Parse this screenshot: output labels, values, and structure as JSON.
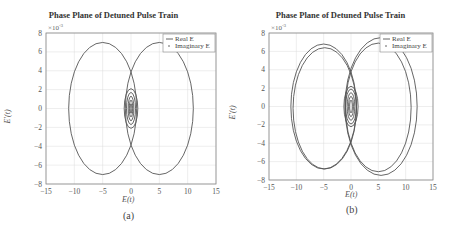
{
  "chart_data": [
    {
      "type": "line",
      "title": "Phase Plane of Detuned Pulse Train",
      "xlabel": "E(t)",
      "ylabel": "E'(t)",
      "y_multiplier": "×10^-3",
      "xlim": [
        -15,
        15
      ],
      "ylim": [
        -8,
        8
      ],
      "xticks": [
        -15,
        -10,
        -5,
        0,
        5,
        10,
        15
      ],
      "yticks": [
        -8,
        -6,
        -4,
        -2,
        0,
        2,
        4,
        6,
        8
      ],
      "grid": true,
      "legend": {
        "position": "upper right",
        "entries": [
          "Real E",
          "Imaginary E"
        ]
      },
      "caption": "(a)",
      "series": [
        {
          "name": "Real E",
          "description": "large ellipse centered near (-5,0), x range ~[-11,1], y range ~[-7,7] plus small oscillations near origin"
        },
        {
          "name": "Imaginary E",
          "description": "large ellipse centered near (5,0), x range ~[-1,11], y range ~[-7,7] plus small oscillations near origin"
        }
      ]
    },
    {
      "type": "line",
      "title": "Phase Plane of Detuned Pulse Train",
      "xlabel": "E(t)",
      "ylabel": "E'(t)",
      "y_multiplier": "×10^-3",
      "xlim": [
        -15,
        15
      ],
      "ylim": [
        -8,
        8
      ],
      "xticks": [
        -15,
        -10,
        -5,
        0,
        5,
        10,
        15
      ],
      "yticks": [
        -8,
        -6,
        -4,
        -2,
        0,
        2,
        4,
        6,
        8
      ],
      "grid": true,
      "legend": {
        "position": "upper right",
        "entries": [
          "Real E",
          "Imaginary E"
        ]
      },
      "caption": "(b)",
      "series": [
        {
          "name": "Real E",
          "description": "double-loop ellipse centered near (-5,0), x range ~[-11,1], y ~[-7,6.8]"
        },
        {
          "name": "Imaginary E",
          "description": "double-loop ellipse centered near (5.5,0), x range ~[-1,12.5], y ~[-7.6,7.5]"
        }
      ]
    }
  ],
  "panels": [
    {
      "title": "Phase Plane of Detuned Pulse Train",
      "xlabel": "E(t)",
      "ylabel": "E'(t)",
      "mult": "×10",
      "exp": "-3",
      "caption": "(a)",
      "legend": [
        "Real E",
        "Imaginary E"
      ]
    },
    {
      "title": "Phase Plane of Detuned Pulse Train",
      "xlabel": "E(t)",
      "ylabel": "E'(t)",
      "mult": "×10",
      "exp": "-3",
      "caption": "(b)",
      "legend": [
        "Real E",
        "Imaginary E"
      ]
    }
  ],
  "colors": {
    "line": "#555555",
    "grid": "#dddddd",
    "axis": "#888888"
  }
}
